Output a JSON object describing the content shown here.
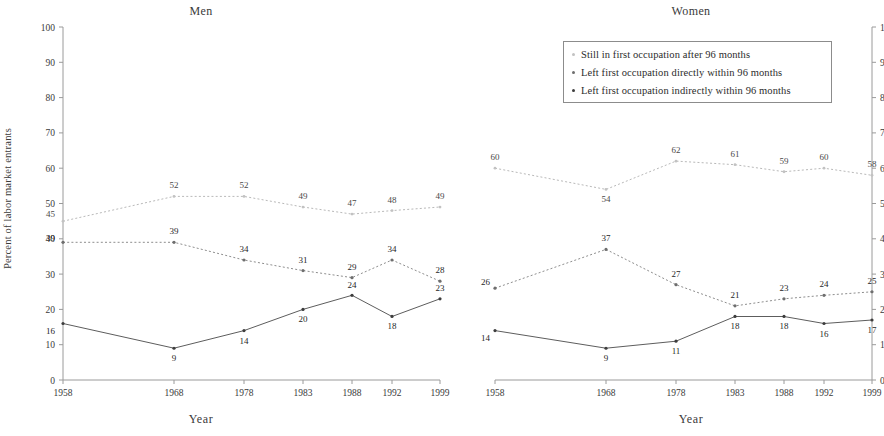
{
  "figure": {
    "panels": [
      {
        "id": "men",
        "title": "Men"
      },
      {
        "id": "women",
        "title": "Women"
      }
    ],
    "axis_titles": {
      "x": "Year",
      "y": "Percent of labor market entrants"
    }
  },
  "legend": {
    "items": [
      {
        "marker": "dot-light-icon",
        "label": "Still in first occupation after 96 months"
      },
      {
        "marker": "dot-mid-icon",
        "label": "Left first occupation directly within 96 months"
      },
      {
        "marker": "dot-dark-icon",
        "label": "Left first occupation indirectly within 96 months"
      }
    ]
  },
  "chart_data": [
    {
      "type": "line",
      "title": "Men",
      "xlabel": "Year",
      "ylabel": "Percent of labor market entrants",
      "categories": [
        "1958",
        "1968",
        "1978",
        "1983",
        "1988",
        "1992",
        "1999"
      ],
      "x": [
        1958,
        1968,
        1978,
        1983,
        1988,
        1992,
        1999
      ],
      "ylim": [
        0,
        100
      ],
      "yticks": [
        0,
        10,
        20,
        30,
        40,
        50,
        60,
        70,
        80,
        90,
        100
      ],
      "grid": false,
      "legend_position": "top-right-outside",
      "y_axis_side": "left",
      "series": [
        {
          "name": "Still in first occupation after 96 months",
          "values": [
            45,
            52,
            52,
            49,
            47,
            48,
            49
          ]
        },
        {
          "name": "Left first occupation directly within 96 months",
          "values": [
            39,
            39,
            34,
            31,
            29,
            34,
            28
          ]
        },
        {
          "name": "Left first occupation indirectly within 96 months",
          "values": [
            16,
            9,
            14,
            20,
            24,
            18,
            23
          ]
        }
      ]
    },
    {
      "type": "line",
      "title": "Women",
      "xlabel": "Year",
      "ylabel": "",
      "categories": [
        "1958",
        "1968",
        "1978",
        "1983",
        "1988",
        "1992",
        "1999"
      ],
      "x": [
        1958,
        1968,
        1978,
        1983,
        1988,
        1992,
        1999
      ],
      "ylim": [
        0,
        100
      ],
      "yticks": [
        0,
        10,
        20,
        30,
        40,
        50,
        60,
        70,
        80,
        90,
        100
      ],
      "grid": false,
      "legend_position": "top-right-inside",
      "y_axis_side": "right",
      "series": [
        {
          "name": "Still in first occupation after 96 months",
          "values": [
            60,
            54,
            62,
            61,
            59,
            60,
            58
          ]
        },
        {
          "name": "Left first occupation directly within 96 months",
          "values": [
            26,
            37,
            27,
            21,
            23,
            24,
            25
          ]
        },
        {
          "name": "Left first occupation indirectly within 96 months",
          "values": [
            14,
            9,
            11,
            18,
            18,
            16,
            17
          ]
        }
      ]
    }
  ]
}
